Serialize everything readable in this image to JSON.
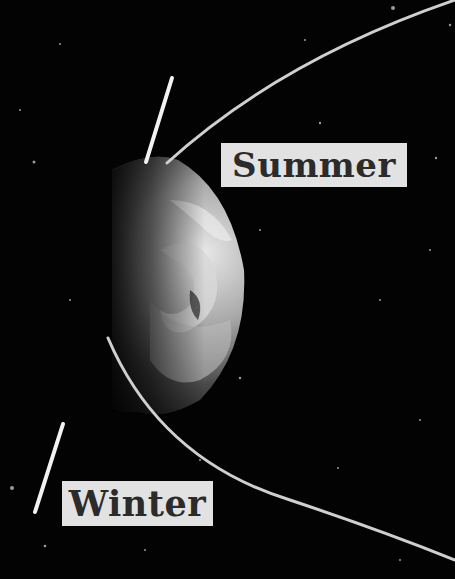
{
  "diagram": {
    "labels": {
      "summer": "Summer",
      "winter": "Winter"
    },
    "colors": {
      "background": "#030303",
      "orbit": "#cfcfcf",
      "axis": "#f2f2f2",
      "label_bg": "#e2e2e2",
      "label_text": "#2b2b2b"
    },
    "elements": [
      "earth-globe",
      "orbit-path",
      "summer-axis-line",
      "winter-axis-line",
      "summer-label",
      "winter-label"
    ]
  }
}
